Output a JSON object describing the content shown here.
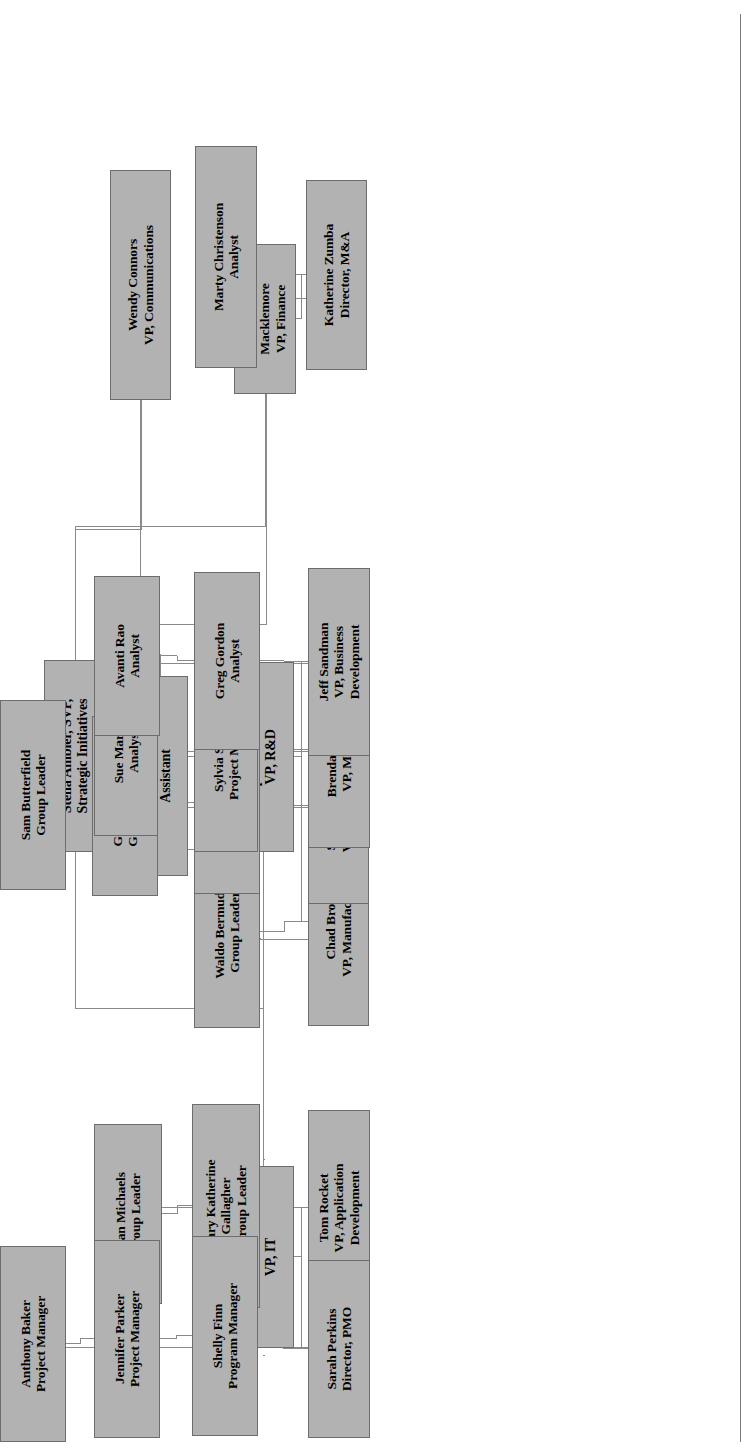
{
  "document": {
    "type": "organizational-chart",
    "orientation": "rotated-90-counterclockwise",
    "box_fill_color": "#b2b2b2",
    "box_border_color": "#6d6d6d",
    "connector_color": "#8a8a8a",
    "text_color": "#000000",
    "background_color": "#ffffff"
  },
  "chart_data": {
    "type": "diagram",
    "title": "",
    "nodes": [
      {
        "id": "stella",
        "name": "Stella Ambler, SVP,",
        "title": "Strategic Initiatives",
        "lines": [
          "Stella Ambler, SVP,",
          "Strategic Initiatives"
        ],
        "level": 0
      },
      {
        "id": "rodney",
        "name": "Rodney Smith",
        "title": "Assistant",
        "lines": [
          "Rodney Smith",
          "Assistant"
        ],
        "level": 1
      },
      {
        "id": "brenda_m",
        "name": "Brenda Macklemore",
        "title": "VP, Finance",
        "lines": [
          "Brenda",
          "Macklemore",
          "VP, Finance"
        ],
        "level": 1
      },
      {
        "id": "wendy",
        "name": "Wendy Connors",
        "title": "VP, Communications",
        "lines": [
          "Wendy Connors",
          "VP, Communications"
        ],
        "level": 1
      },
      {
        "id": "cooper",
        "name": "Cooper Townsend",
        "title": "VP, R&D",
        "lines": [
          "Cooper Townsend",
          "VP, R&D"
        ],
        "level": 1
      },
      {
        "id": "david",
        "name": "David Sanders",
        "title": "VP, IT",
        "lines": [
          "David Sanders",
          "VP, IT"
        ],
        "level": 1
      },
      {
        "id": "katherine",
        "name": "Katherine Zumba",
        "title": "Director, M&A",
        "lines": [
          "Katherine Zumba",
          "Director, M&A"
        ],
        "level": 2
      },
      {
        "id": "marty",
        "name": "Marty Christenson",
        "title": "Analyst",
        "lines": [
          "Marty Christenson",
          "Analyst"
        ],
        "level": 3
      },
      {
        "id": "chad",
        "name": "Chad Brooks",
        "title": "VP, Manufacturing",
        "lines": [
          "Chad Brooks",
          "VP, Manufacturing"
        ],
        "level": 2
      },
      {
        "id": "scott",
        "name": "Scott Stevenson",
        "title": "VP, Engineering",
        "lines": [
          "Scott Stevenson",
          "VP, Engineering"
        ],
        "level": 2
      },
      {
        "id": "brenda_p",
        "name": "Brenda Peterson",
        "title": "VP, Marketing",
        "lines": [
          "Brenda Peterson",
          "VP, Marketing"
        ],
        "level": 2
      },
      {
        "id": "jeff",
        "name": "Jeff Sandman",
        "title": "VP, Business Development",
        "lines": [
          "Jeff Sandman",
          "VP, Business",
          "Development"
        ],
        "level": 2
      },
      {
        "id": "waldo",
        "name": "Waldo Bermuda",
        "title": "Group Leader",
        "lines": [
          "Waldo Bermuda",
          "Group Leader"
        ],
        "level": 3
      },
      {
        "id": "ben",
        "name": "Ben Bowman",
        "title": "Group Leader",
        "lines": [
          "Ben Bowman",
          "Group Leader"
        ],
        "level": 3
      },
      {
        "id": "gloria",
        "name": "Gloria Gulatti",
        "title": "Group Leader",
        "lines": [
          "Gloria Gulatti",
          "Group Leader"
        ],
        "level": 4
      },
      {
        "id": "sam",
        "name": "Sam Butterfield",
        "title": "Group Leader",
        "lines": [
          "Sam Butterfield",
          "Group Leader"
        ],
        "level": 5
      },
      {
        "id": "sylvia",
        "name": "Sylvia Stanley",
        "title": "Project Manager",
        "lines": [
          "Sylvia Stanley",
          "Project Manager"
        ],
        "level": 3
      },
      {
        "id": "sue",
        "name": "Sue Martin",
        "title": "Analyst",
        "lines": [
          "Sue Martin",
          "Analyst"
        ],
        "level": 4
      },
      {
        "id": "greg",
        "name": "Greg Gordon",
        "title": "Analyst",
        "lines": [
          "Greg Gordon",
          "Analyst"
        ],
        "level": 3
      },
      {
        "id": "avanti",
        "name": "Avanti Rao",
        "title": "Analyst",
        "lines": [
          "Avanti Rao",
          "Analyst"
        ],
        "level": 4
      },
      {
        "id": "tom",
        "name": "Tom Rocket",
        "title": "VP, Application Development",
        "lines": [
          "Tom Rocket",
          "VP, Application",
          "Development"
        ],
        "level": 2
      },
      {
        "id": "sarah",
        "name": "Sarah Perkins",
        "title": "Director, PMO",
        "lines": [
          "Sarah Perkins",
          "Director, PMO"
        ],
        "level": 2
      },
      {
        "id": "marykath",
        "name": "Mary Katherine Gallagher",
        "title": "Group Leader",
        "lines": [
          "Mary Katherine",
          "Gallagher",
          "Group Leader"
        ],
        "level": 3
      },
      {
        "id": "evan",
        "name": "Evan Michaels",
        "title": "Group Leader",
        "lines": [
          "Evan Michaels",
          "Group Leader"
        ],
        "level": 4
      },
      {
        "id": "shelly",
        "name": "Shelly Finn",
        "title": "Program Manager",
        "lines": [
          "Shelly Finn",
          "Program Manager"
        ],
        "level": 3
      },
      {
        "id": "jennifer",
        "name": "Jennifer Parker",
        "title": "Project Manager",
        "lines": [
          "Jennifer Parker",
          "Project Manager"
        ],
        "level": 4
      },
      {
        "id": "anthony",
        "name": "Anthony Baker",
        "title": "Project Manager",
        "lines": [
          "Anthony Baker",
          "Project Manager"
        ],
        "level": 5
      }
    ],
    "edges": [
      {
        "from": "stella",
        "to": "rodney"
      },
      {
        "from": "stella",
        "to": "brenda_m"
      },
      {
        "from": "stella",
        "to": "wendy"
      },
      {
        "from": "stella",
        "to": "cooper"
      },
      {
        "from": "stella",
        "to": "david"
      },
      {
        "from": "brenda_m",
        "to": "katherine"
      },
      {
        "from": "katherine",
        "to": "marty"
      },
      {
        "from": "cooper",
        "to": "chad"
      },
      {
        "from": "cooper",
        "to": "scott"
      },
      {
        "from": "cooper",
        "to": "brenda_p"
      },
      {
        "from": "cooper",
        "to": "jeff"
      },
      {
        "from": "chad",
        "to": "waldo"
      },
      {
        "from": "scott",
        "to": "ben"
      },
      {
        "from": "ben",
        "to": "gloria"
      },
      {
        "from": "gloria",
        "to": "sam"
      },
      {
        "from": "brenda_p",
        "to": "sylvia"
      },
      {
        "from": "sylvia",
        "to": "sue"
      },
      {
        "from": "jeff",
        "to": "greg"
      },
      {
        "from": "greg",
        "to": "avanti"
      },
      {
        "from": "david",
        "to": "tom"
      },
      {
        "from": "david",
        "to": "sarah"
      },
      {
        "from": "tom",
        "to": "marykath"
      },
      {
        "from": "marykath",
        "to": "evan"
      },
      {
        "from": "sarah",
        "to": "shelly"
      },
      {
        "from": "shelly",
        "to": "jennifer"
      },
      {
        "from": "jennifer",
        "to": "anthony"
      }
    ]
  },
  "labels": {
    "stella": {
      "lines": [
        "Stella Ambler, SVP,",
        "Strategic Initiatives"
      ]
    },
    "rodney": {
      "lines": [
        "Rodney Smith",
        "Assistant"
      ]
    },
    "brenda_m": {
      "lines": [
        "Brenda",
        "Macklemore",
        "VP, Finance"
      ]
    },
    "wendy": {
      "lines": [
        "Wendy Connors",
        "VP, Communications"
      ]
    },
    "cooper": {
      "lines": [
        "Cooper Townsend",
        "VP, R&D"
      ]
    },
    "david": {
      "lines": [
        "David Sanders",
        "VP, IT"
      ]
    },
    "katherine": {
      "lines": [
        "Katherine Zumba",
        "Director, M&A"
      ]
    },
    "marty": {
      "lines": [
        "Marty Christenson",
        "Analyst"
      ]
    },
    "chad": {
      "lines": [
        "Chad Brooks",
        "VP, Manufacturing"
      ]
    },
    "scott": {
      "lines": [
        "Scott Stevenson",
        "VP, Engineering"
      ]
    },
    "brenda_p": {
      "lines": [
        "Brenda Peterson",
        "VP, Marketing"
      ]
    },
    "jeff": {
      "lines": [
        "Jeff Sandman",
        "VP, Business",
        "Development"
      ]
    },
    "waldo": {
      "lines": [
        "Waldo Bermuda",
        "Group Leader"
      ]
    },
    "ben": {
      "lines": [
        "Ben Bowman",
        "Group Leader"
      ]
    },
    "gloria": {
      "lines": [
        "Gloria Gulatti",
        "Group Leader"
      ]
    },
    "sam": {
      "lines": [
        "Sam Butterfield",
        "Group Leader"
      ]
    },
    "sylvia": {
      "lines": [
        "Sylvia Stanley",
        "Project Manager"
      ]
    },
    "sue": {
      "lines": [
        "Sue Martin",
        "Analyst"
      ]
    },
    "greg": {
      "lines": [
        "Greg Gordon",
        "Analyst"
      ]
    },
    "avanti": {
      "lines": [
        "Avanti Rao",
        "Analyst"
      ]
    },
    "tom": {
      "lines": [
        "Tom Rocket",
        "VP, Application",
        "Development"
      ]
    },
    "sarah": {
      "lines": [
        "Sarah Perkins",
        "Director, PMO"
      ]
    },
    "marykath": {
      "lines": [
        "Mary Katherine",
        "Gallagher",
        "Group Leader"
      ]
    },
    "evan": {
      "lines": [
        "Evan Michaels",
        "Group Leader"
      ]
    },
    "shelly": {
      "lines": [
        "Shelly Finn",
        "Program Manager"
      ]
    },
    "jennifer": {
      "lines": [
        "Jennifer Parker",
        "Project Manager"
      ]
    },
    "anthony": {
      "lines": [
        "Anthony Baker",
        "Project Manager"
      ]
    }
  },
  "layout": {
    "nodes": {
      "stella": {
        "x": 604,
        "y": 44,
        "w": 192,
        "h": 62,
        "fs": 14
      },
      "rodney": {
        "x": 580,
        "y": 128,
        "w": 200,
        "h": 60,
        "fs": 14
      },
      "brenda_m": {
        "x": 1062,
        "y": 234,
        "w": 150,
        "h": 62,
        "fs": 13.5
      },
      "wendy": {
        "x": 1056,
        "y": 110,
        "w": 230,
        "h": 61,
        "fs": 13.5
      },
      "cooper": {
        "x": 604,
        "y": 232,
        "w": 190,
        "h": 62,
        "fs": 14
      },
      "david": {
        "x": 108,
        "y": 232,
        "w": 182,
        "h": 62,
        "fs": 14
      },
      "katherine": {
        "x": 1086,
        "y": 306,
        "w": 190,
        "h": 61,
        "fs": 13.5
      },
      "marty": {
        "x": 1088,
        "y": 195,
        "w": 222,
        "h": 62,
        "fs": 13.5
      },
      "chad": {
        "x": 430,
        "y": 308,
        "w": 208,
        "h": 61,
        "fs": 13.5
      },
      "scott": {
        "x": 552,
        "y": 308,
        "w": 196,
        "h": 61,
        "fs": 13.5
      },
      "brenda_p": {
        "x": 608,
        "y": 308,
        "w": 196,
        "h": 62,
        "fs": 13.5
      },
      "jeff": {
        "x": 700,
        "y": 308,
        "w": 188,
        "h": 62,
        "fs": 13.5
      },
      "waldo": {
        "x": 428,
        "y": 194,
        "w": 192,
        "h": 66,
        "fs": 13.5
      },
      "ben": {
        "x": 562,
        "y": 194,
        "w": 182,
        "h": 66,
        "fs": 13.5
      },
      "gloria": {
        "x": 560,
        "y": 92,
        "w": 180,
        "h": 66,
        "fs": 13.5
      },
      "sam": {
        "x": 566,
        "y": 0,
        "w": 190,
        "h": 66,
        "fs": 13.5
      },
      "sylvia": {
        "x": 604,
        "y": 194,
        "w": 200,
        "h": 64,
        "fs": 13.5
      },
      "sue": {
        "x": 620,
        "y": 94,
        "w": 170,
        "h": 64,
        "fs": 13.5
      },
      "greg": {
        "x": 706,
        "y": 194,
        "w": 178,
        "h": 66,
        "fs": 13.5
      },
      "avanti": {
        "x": 720,
        "y": 94,
        "w": 160,
        "h": 66,
        "fs": 13.5
      },
      "tom": {
        "x": 150,
        "y": 308,
        "w": 196,
        "h": 62,
        "fs": 13.5
      },
      "sarah": {
        "x": 18,
        "y": 308,
        "w": 178,
        "h": 62,
        "fs": 13.5
      },
      "marykath": {
        "x": 148,
        "y": 192,
        "w": 204,
        "h": 68,
        "fs": 13.5
      },
      "evan": {
        "x": 152,
        "y": 94,
        "w": 180,
        "h": 68,
        "fs": 13.5
      },
      "shelly": {
        "x": 20,
        "y": 192,
        "w": 200,
        "h": 66,
        "fs": 13.5
      },
      "jennifer": {
        "x": 18,
        "y": 94,
        "w": 198,
        "h": 66,
        "fs": 13.5
      },
      "anthony": {
        "x": 14,
        "y": 0,
        "w": 196,
        "h": 66,
        "fs": 13.5
      }
    },
    "connectors": [
      {
        "name": "stella-trunk-h",
        "o": "h",
        "x": 796,
        "y": 158,
        "w": 6,
        "h": 1
      },
      {
        "name": "stella-to-rodney",
        "o": "v",
        "x": 801,
        "y": 128,
        "w": 1,
        "h": 31
      },
      {
        "name": "stella-bus-v",
        "o": "v",
        "x": 801,
        "y": 158,
        "w": 1,
        "h": 147
      },
      {
        "name": "stella-bus-v-up",
        "o": "v",
        "x": 801,
        "y": 204,
        "w": 1,
        "h": 2
      },
      {
        "name": "bus-to-wendy",
        "o": "h",
        "x": 801,
        "y": 140,
        "w": 255,
        "h": 1
      },
      {
        "name": "bus-wendy-v",
        "o": "v",
        "x": 1056,
        "y": 140,
        "w": 1,
        "h": 1
      },
      {
        "name": "bus-to-brendam",
        "o": "h",
        "x": 801,
        "y": 265,
        "w": 261,
        "h": 1
      },
      {
        "name": "bus-left-to-cooper",
        "o": "h",
        "x": 794,
        "y": 263,
        "w": 8,
        "h": 1
      },
      {
        "name": "bus-left-to-david",
        "o": "h",
        "x": 290,
        "y": 263,
        "w": 6,
        "h": 1
      },
      {
        "name": "david-branch-v",
        "o": "v",
        "x": 296,
        "y": 263,
        "w": 1,
        "h": 1
      },
      {
        "name": "cooper-left-v",
        "o": "v",
        "x": 296,
        "y": 263,
        "w": 1,
        "h": 1
      },
      {
        "name": "brendam-down",
        "o": "v",
        "x": 1137,
        "y": 296,
        "w": 1,
        "h": 24
      },
      {
        "name": "brendam-to-kath-h",
        "o": "h",
        "x": 1086,
        "y": 320,
        "w": 51,
        "h": 1
      },
      {
        "name": "kath-to-marty-h",
        "o": "h",
        "x": 1137,
        "y": 320,
        "w": 1,
        "h": 1
      },
      {
        "name": "kath-down",
        "o": "v",
        "x": 1181,
        "y": 296,
        "w": 1,
        "h": 24
      },
      {
        "name": "kath-marty-v",
        "o": "v",
        "x": 1199,
        "y": 257,
        "w": 1,
        "h": 63
      },
      {
        "name": "kath-marty-h",
        "o": "h",
        "x": 1137,
        "y": 320,
        "w": 62,
        "h": 1
      },
      {
        "name": "cooper-bus-v",
        "o": "v",
        "x": 658,
        "y": 340,
        "w": 1,
        "h": 96
      },
      {
        "name": "cooper-stem",
        "o": "h",
        "x": 658,
        "y": 263,
        "w": 136,
        "h": 1
      },
      {
        "name": "cooper-bus-main",
        "o": "v",
        "x": 658,
        "y": 263,
        "w": 1,
        "h": 130
      },
      {
        "name": "cooper-to-chad",
        "o": "h",
        "x": 638,
        "y": 340,
        "w": 20,
        "h": 1
      },
      {
        "name": "cooper-to-scott",
        "o": "h",
        "x": 638,
        "y": 340,
        "w": 1,
        "h": 1
      },
      {
        "name": "edge-rule",
        "o": "v",
        "x": 0,
        "y": 0,
        "w": 0,
        "h": 0
      }
    ]
  }
}
